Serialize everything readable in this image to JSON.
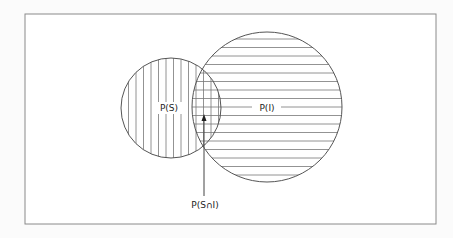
{
  "diagram": {
    "type": "venn",
    "frame": {
      "x": 25,
      "y": 14,
      "width": 411,
      "height": 210,
      "stroke": "#8a8a8a"
    },
    "sets": [
      {
        "id": "S",
        "label": "P(S)",
        "circle": {
          "cx": 171,
          "cy": 108,
          "r": 50
        },
        "hatch": "vertical",
        "hatch_spacing": 7.5,
        "label_pos": {
          "x": 163,
          "y": 111
        }
      },
      {
        "id": "I",
        "label": "P(I)",
        "circle": {
          "cx": 267,
          "cy": 107,
          "r": 75
        },
        "hatch": "horizontal",
        "hatch_spacing": 8.5,
        "label_pos": {
          "x": 265,
          "y": 111
        }
      }
    ],
    "intersection": {
      "label": "P(S∩I)",
      "arrow": {
        "x": 204,
        "from_y": 193,
        "to_y": 115
      },
      "label_pos": {
        "x": 205,
        "y": 208
      }
    },
    "colors": {
      "line": "#555555",
      "hatch": "#777777",
      "background": "#fbfbfb"
    }
  }
}
